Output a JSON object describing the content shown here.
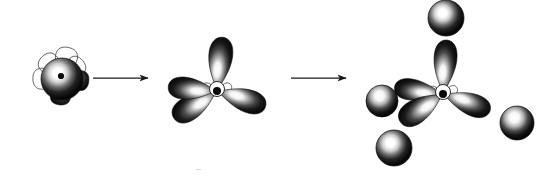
{
  "figure": {
    "background_color": "#ffffff",
    "width": 539,
    "height": 177,
    "ink_color": "#111111",
    "outline_color": "#3a3a3a",
    "highlight_color": "#ffffff",
    "arrow_color": "#1a1a1a",
    "faint_caption": "─"
  },
  "stages": [
    {
      "id": "stage-1",
      "name": "unhybridized-atomic-orbitals",
      "label": "Unhybridized s and p atomic orbitals",
      "center_x": 62,
      "center_y": 78,
      "components": [
        {
          "kind": "s-orbital-sphere",
          "name": "central-s-orbital",
          "cx": 62,
          "cy": 79,
          "r": 21
        },
        {
          "kind": "p-lobe-filled",
          "name": "p-orbital-lobe-right",
          "angle_deg": 8,
          "length": 26,
          "width": 20
        },
        {
          "kind": "p-lobe-filled",
          "name": "p-orbital-lobe-down",
          "angle_deg": 95,
          "length": 26,
          "width": 20
        },
        {
          "kind": "p-lobe-outline",
          "name": "p-orbital-outline-up",
          "angle_deg": -78,
          "length": 30,
          "width": 22
        },
        {
          "kind": "p-lobe-outline",
          "name": "p-orbital-outline-upleft",
          "angle_deg": -132,
          "length": 28,
          "width": 21
        },
        {
          "kind": "p-lobe-outline",
          "name": "p-orbital-outline-left",
          "angle_deg": 178,
          "length": 28,
          "width": 21
        },
        {
          "kind": "p-lobe-outline",
          "name": "p-orbital-outline-upright",
          "angle_deg": -40,
          "length": 26,
          "width": 20
        }
      ]
    },
    {
      "id": "stage-2",
      "name": "sp3-hybrid-orbitals",
      "label": "Four sp3 hybrid orbitals in tetrahedral arrangement",
      "center_x": 217,
      "center_y": 91,
      "components": [
        {
          "kind": "hybrid-lobe",
          "name": "hybrid-orbital-up",
          "angle_deg": -84,
          "length": 53,
          "width": 27
        },
        {
          "kind": "hybrid-lobe",
          "name": "hybrid-orbital-upper-left",
          "angle_deg": 185,
          "length": 48,
          "width": 25
        },
        {
          "kind": "hybrid-lobe",
          "name": "hybrid-orbital-lower-left",
          "angle_deg": 148,
          "length": 50,
          "width": 27
        },
        {
          "kind": "hybrid-lobe",
          "name": "hybrid-orbital-right",
          "angle_deg": 18,
          "length": 50,
          "width": 26
        },
        {
          "kind": "nucleus",
          "name": "nucleus-dot",
          "cx": 217,
          "cy": 91,
          "r": 4
        }
      ]
    },
    {
      "id": "stage-3",
      "name": "bonded-tetrahedral-molecule",
      "label": "sp3 orbitals overlapping with four 1s orbitals",
      "center_x": 443,
      "center_y": 94,
      "components": [
        {
          "kind": "hybrid-lobe",
          "name": "hybrid-orbital-up",
          "angle_deg": -86,
          "length": 53,
          "width": 26
        },
        {
          "kind": "hybrid-lobe",
          "name": "hybrid-orbital-upper-left",
          "angle_deg": 188,
          "length": 48,
          "width": 24
        },
        {
          "kind": "hybrid-lobe",
          "name": "hybrid-orbital-lower-left",
          "angle_deg": 147,
          "length": 50,
          "width": 27
        },
        {
          "kind": "hybrid-lobe",
          "name": "hybrid-orbital-right",
          "angle_deg": 20,
          "length": 49,
          "width": 25
        },
        {
          "kind": "nucleus",
          "name": "nucleus-dot",
          "cx": 443,
          "cy": 94,
          "r": 4
        },
        {
          "kind": "s-orbital-sphere",
          "name": "bonded-1s-orbital-top",
          "cx": 446,
          "cy": 18,
          "r": 18
        },
        {
          "kind": "s-orbital-sphere",
          "name": "bonded-1s-orbital-left",
          "cx": 382,
          "cy": 101,
          "r": 16
        },
        {
          "kind": "s-orbital-sphere",
          "name": "bonded-1s-orbital-lower-left",
          "cx": 394,
          "cy": 148,
          "r": 18
        },
        {
          "kind": "s-orbital-sphere",
          "name": "bonded-1s-orbital-right",
          "cx": 517,
          "cy": 123,
          "r": 17
        }
      ]
    }
  ],
  "arrows": [
    {
      "id": "arrow-1",
      "name": "transformation-arrow-1",
      "label": "hybridization step",
      "x1": 93,
      "y1": 78,
      "x2": 148,
      "y2": 78
    },
    {
      "id": "arrow-2",
      "name": "transformation-arrow-2",
      "label": "bonding step",
      "x1": 291,
      "y1": 78,
      "x2": 346,
      "y2": 78
    }
  ]
}
